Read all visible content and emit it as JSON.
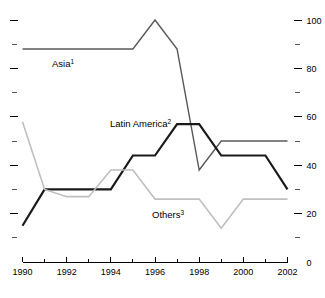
{
  "chart_data": {
    "type": "line",
    "title": "",
    "subtitle": "",
    "xlabel": "",
    "ylabel": "",
    "x": [
      1990,
      1991,
      1992,
      1993,
      1994,
      1995,
      1996,
      1997,
      1998,
      1999,
      2000,
      2001,
      2002
    ],
    "xlim": [
      1990,
      2002
    ],
    "ylim": [
      0,
      100
    ],
    "grid": false,
    "legend_position": "inline-annotations",
    "x_tick_labels": [
      "1990",
      "1992",
      "1994",
      "1996",
      "1998",
      "2000",
      "2002"
    ],
    "x_tick_values": [
      1990,
      1992,
      1994,
      1996,
      1998,
      2000,
      2002
    ],
    "x_minor_tick_values": [
      1991,
      1993,
      1995,
      1997,
      1999,
      2001
    ],
    "y_tick_labels": [
      "0",
      "20",
      "40",
      "60",
      "80",
      "100"
    ],
    "y_tick_values": [
      0,
      20,
      40,
      60,
      80,
      100
    ],
    "y_minor_tick_values": [
      10,
      30,
      50,
      70,
      90
    ],
    "series": [
      {
        "name": "Asia",
        "label": "Asia",
        "footnote": "1",
        "color": "#595959",
        "width": 1.4,
        "values": [
          88,
          88,
          88,
          88,
          88,
          88,
          100,
          88,
          38,
          50,
          50,
          50,
          50
        ]
      },
      {
        "name": "Latin America",
        "label": "Latin America",
        "footnote": "2",
        "color": "#1a1a1a",
        "width": 2.2,
        "values": [
          15,
          30,
          30,
          30,
          30,
          44,
          44,
          57,
          57,
          44,
          44,
          44,
          30
        ]
      },
      {
        "name": "Others",
        "label": "Others",
        "footnote": "3",
        "color": "#bfbfbf",
        "width": 1.6,
        "values": [
          58,
          30,
          27,
          27,
          38,
          38,
          26,
          26,
          26,
          14,
          26,
          26,
          26
        ]
      }
    ],
    "annotations": [
      {
        "text": "Asia",
        "footnote": "1",
        "x_px": 52,
        "y_px": 67
      },
      {
        "text": "Latin America",
        "footnote": "2",
        "x_px": 110,
        "y_px": 127
      },
      {
        "text": "Others",
        "footnote": "3",
        "x_px": 152,
        "y_px": 218
      }
    ]
  }
}
